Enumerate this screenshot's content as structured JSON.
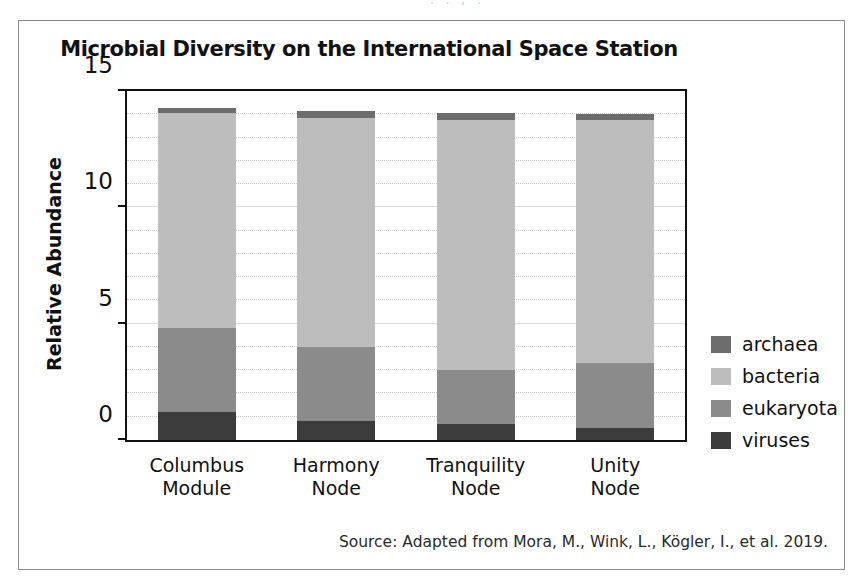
{
  "figure": {
    "title": "Microbial Diversity on the International Space Station",
    "source_note": "Source: Adapted from Mora, M., Wink, L., Kögler, I., et al. 2019.",
    "scan_artifact_text": ". . , ."
  },
  "chart_data": {
    "type": "bar",
    "subtype": "stacked-column",
    "title": "Microbial Diversity on the International Space Station",
    "xlabel": "",
    "ylabel": "Relative Abundance",
    "ylim": [
      0,
      15
    ],
    "yticks": [
      0,
      5,
      10,
      15
    ],
    "ytick_labels": [
      "0",
      "5",
      "10",
      "15"
    ],
    "grid": true,
    "legend_position": "right",
    "categories": [
      "Columbus Module",
      "Harmony Node",
      "Tranquility Node",
      "Unity Node"
    ],
    "category_lines": [
      [
        "Columbus",
        "Module"
      ],
      [
        "Harmony",
        "Node"
      ],
      [
        "Tranquility",
        "Node"
      ],
      [
        "Unity",
        "Node"
      ]
    ],
    "stack_order_bottom_to_top": [
      "viruses",
      "eukaryota",
      "bacteria",
      "archaea"
    ],
    "series": [
      {
        "name": "viruses",
        "color": "#3c3c3c",
        "values": [
          1.2,
          0.8,
          0.7,
          0.5
        ]
      },
      {
        "name": "eukaryota",
        "color": "#8b8b8b",
        "values": [
          3.6,
          3.2,
          2.3,
          2.8
        ]
      },
      {
        "name": "bacteria",
        "color": "#bdbdbd",
        "values": [
          9.25,
          9.85,
          10.75,
          10.45
        ]
      },
      {
        "name": "archaea",
        "color": "#6d6d6d",
        "values": [
          0.2,
          0.3,
          0.3,
          0.25
        ]
      }
    ],
    "totals": [
      14.25,
      14.15,
      14.05,
      14.0
    ]
  },
  "legend": {
    "items": [
      {
        "label": "archaea",
        "color": "#6d6d6d"
      },
      {
        "label": "bacteria",
        "color": "#bdbdbd"
      },
      {
        "label": "eukaryota",
        "color": "#8b8b8b"
      },
      {
        "label": "viruses",
        "color": "#3c3c3c"
      }
    ]
  }
}
